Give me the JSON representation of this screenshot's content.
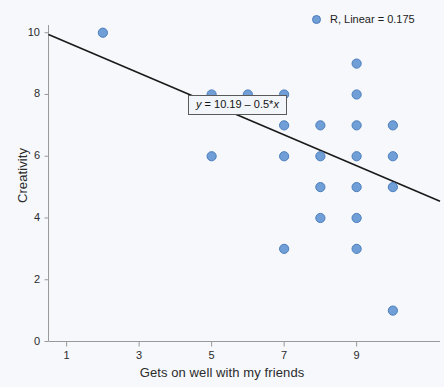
{
  "chart_data": {
    "type": "scatter",
    "title": "",
    "xlabel": "Gets on well with my friends",
    "ylabel": "Creativity",
    "xlim": [
      0.5,
      11.3
    ],
    "ylim": [
      0,
      10.25
    ],
    "xticks": [
      1,
      3,
      5,
      7,
      9
    ],
    "yticks": [
      0,
      2,
      4,
      6,
      8,
      10
    ],
    "grid": false,
    "legend_position": "top-right",
    "legend_entries": [
      {
        "label": "R, Linear = 0.175",
        "marker": "circle",
        "color": "#6f9fd6"
      }
    ],
    "series": [
      {
        "name": "observations",
        "marker_color": "#6f9fd6",
        "marker_edge_color": "#4c7ebd",
        "points": [
          {
            "x": 2,
            "y": 10
          },
          {
            "x": 5,
            "y": 8
          },
          {
            "x": 5,
            "y": 6
          },
          {
            "x": 6,
            "y": 8
          },
          {
            "x": 7,
            "y": 8
          },
          {
            "x": 7,
            "y": 7
          },
          {
            "x": 7,
            "y": 6
          },
          {
            "x": 7,
            "y": 3
          },
          {
            "x": 8,
            "y": 7
          },
          {
            "x": 8,
            "y": 6
          },
          {
            "x": 8,
            "y": 5
          },
          {
            "x": 8,
            "y": 4
          },
          {
            "x": 9,
            "y": 9
          },
          {
            "x": 9,
            "y": 8
          },
          {
            "x": 9,
            "y": 7
          },
          {
            "x": 9,
            "y": 6
          },
          {
            "x": 9,
            "y": 5
          },
          {
            "x": 9,
            "y": 4
          },
          {
            "x": 9,
            "y": 3
          },
          {
            "x": 10,
            "y": 7
          },
          {
            "x": 10,
            "y": 6
          },
          {
            "x": 10,
            "y": 5
          },
          {
            "x": 10,
            "y": 1
          }
        ]
      }
    ],
    "fit_line": {
      "equation_label": "y = 10.19 – 0.5*x",
      "equation_y": "y",
      "equation_rest": " = 10.19 – 0.5*",
      "equation_x": "x",
      "intercept": 10.19,
      "slope": -0.5,
      "x_start": 0.5,
      "x_end": 11.3,
      "color": "#1a1a1a"
    },
    "r_value_label": "R, Linear = 0.175",
    "annotations": [
      {
        "name": "equation-callout",
        "text": "y = 10.19 – 0.5*x"
      }
    ]
  },
  "axes": {
    "x_title": "Gets on well with my friends",
    "y_title": "Creativity",
    "x_tick_labels": [
      "1",
      "3",
      "5",
      "7",
      "9"
    ],
    "y_tick_labels": [
      "0",
      "2",
      "4",
      "6",
      "8",
      "10"
    ]
  },
  "legend": {
    "text": "R, Linear = 0.175"
  },
  "colors": {
    "background": "#f6f8fb",
    "marker_fill": "#6f9fd6",
    "marker_edge": "#4c7ebd",
    "axis": "#9a9a9a",
    "fit_line": "#1a1a1a",
    "text": "#2b2b2b"
  }
}
